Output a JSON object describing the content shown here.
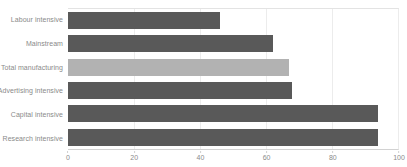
{
  "chart_data": {
    "type": "bar",
    "orientation": "horizontal",
    "title": "",
    "subtitle": "",
    "xlabel": "",
    "ylabel": "",
    "categories": [
      "Labour intensive",
      "Mainstream",
      "Total manufacturing",
      "Advertising intensive",
      "Capital intensive",
      "Research intensive"
    ],
    "values": [
      46,
      62,
      67,
      68,
      94,
      94
    ],
    "series": [
      {
        "name": "",
        "values": [
          46,
          62,
          67,
          68,
          94,
          94
        ]
      }
    ],
    "highlight_index": 2,
    "bar_colors": [
      "#595959",
      "#595959",
      "#b2b2b2",
      "#595959",
      "#595959",
      "#595959"
    ],
    "xlim": [
      0,
      100
    ],
    "xticks": [
      0,
      20,
      40,
      60,
      80,
      100
    ],
    "xtick_labels": [
      "0",
      "20",
      "40",
      "60",
      "80",
      "100"
    ],
    "grid": "vertical",
    "legend": "none",
    "annotations": []
  },
  "colors": {
    "bar_default": "#595959",
    "bar_highlight": "#b2b2b2",
    "gridline": "#ececec",
    "axis_line": "#d2d2d2",
    "tick_text": "#8a8a8a",
    "category_text": "#8a8a8a",
    "background": "#ffffff"
  }
}
